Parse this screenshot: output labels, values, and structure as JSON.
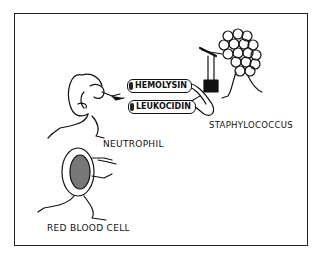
{
  "figure": {
    "type": "cartoon-illustration",
    "labels": {
      "neutrophil": "NEUTROPHIL",
      "red_blood_cell": "RED BLOOD CELL",
      "staphylococcus": "STAPHYLOCOCCUS"
    },
    "toxins": [
      {
        "name": "HEMOLYSIN"
      },
      {
        "name": "LEUKOCIDIN"
      }
    ],
    "colors": {
      "ink": "#111111",
      "background": "#ffffff",
      "frame": "#222222"
    }
  }
}
